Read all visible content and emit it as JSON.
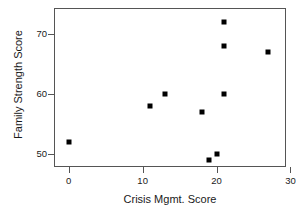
{
  "chart_data": {
    "type": "scatter",
    "title": "",
    "xlabel": "Crisis Mgmt. Score",
    "ylabel": "Family Strength Score",
    "xlim": [
      -2,
      29.4
    ],
    "ylim": [
      47.8,
      74.3
    ],
    "xticks": [
      0,
      10,
      20,
      30
    ],
    "xtick_labels": [
      "0",
      "10",
      "20",
      "30"
    ],
    "yticks": [
      50,
      60,
      70
    ],
    "ytick_labels": [
      "50",
      "60",
      "70"
    ],
    "grid": false,
    "legend": null,
    "marker": "square",
    "marker_color": "#000000",
    "points": [
      {
        "x": 0,
        "y": 52
      },
      {
        "x": 11,
        "y": 58
      },
      {
        "x": 13,
        "y": 60
      },
      {
        "x": 18,
        "y": 57
      },
      {
        "x": 19,
        "y": 49
      },
      {
        "x": 20,
        "y": 50
      },
      {
        "x": 21,
        "y": 60
      },
      {
        "x": 21,
        "y": 68
      },
      {
        "x": 21,
        "y": 72
      },
      {
        "x": 27,
        "y": 67
      }
    ]
  }
}
